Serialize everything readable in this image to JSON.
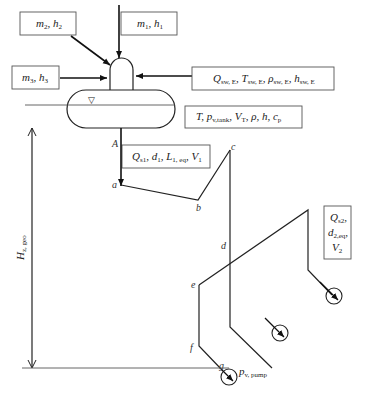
{
  "diagram": {
    "inlets": {
      "m2": {
        "base": "m",
        "sub": "2",
        "base2": "h",
        "sub2": "2"
      },
      "m1": {
        "base": "m",
        "sub": "1",
        "base2": "h",
        "sub2": "1"
      },
      "m3": {
        "base": "m",
        "sub": "3",
        "base2": "h",
        "sub2": "3"
      }
    },
    "seawater_box": {
      "q": "Q",
      "q_sub": "sw, E",
      "t": "T",
      "t_sub": "sw, E",
      "rho": "ρ",
      "rho_sub": "sw, E",
      "h": "h",
      "h_sub": "sw, E"
    },
    "tank_box": {
      "t": "T",
      "p": "p",
      "p_sub": "v,tank",
      "v": "V",
      "v_sub": "T",
      "rest": ", ρ, h, c",
      "c_sub": "p"
    },
    "pipe1_box": {
      "q": "Q",
      "q_sub": "s1",
      "d": "d",
      "d_sub": "1",
      "l": "L",
      "l_sub": "1, eq",
      "v": "V",
      "v_sub": "1"
    },
    "pipe2_box": {
      "q": "Q",
      "q_sub": "s2",
      "d": "d",
      "d_sub": "2,eq",
      "v": "V",
      "v_sub": "2"
    },
    "height_label": {
      "base": "H",
      "sub": "z, geo"
    },
    "pump_label": {
      "base": "p",
      "sub": "v, pump"
    },
    "points": {
      "A": "A",
      "a": "a",
      "b": "b",
      "c": "c",
      "d": "d",
      "e": "e",
      "f": "f",
      "g": "g"
    },
    "water_level_symbol": "▽"
  }
}
